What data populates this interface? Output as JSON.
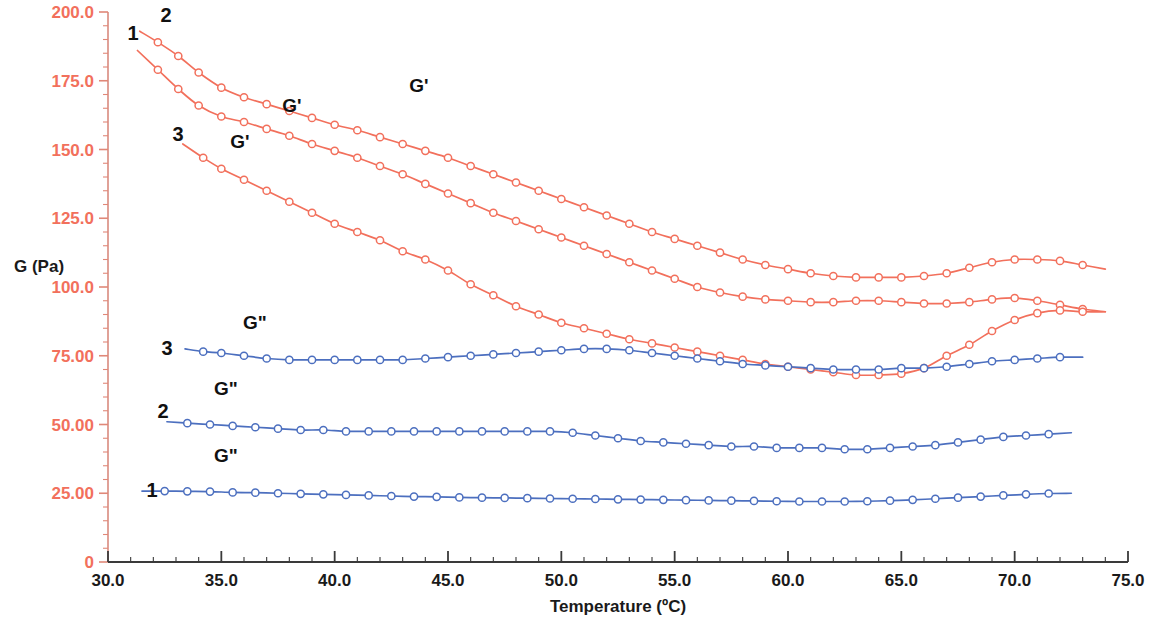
{
  "chart_data": {
    "type": "line",
    "title": "",
    "xlabel": "Temperature (ºC)",
    "ylabel": "G (Pa)",
    "xlim": [
      30.0,
      75.0
    ],
    "ylim": [
      0,
      200
    ],
    "grid": false,
    "legend_position": "inline-annotations",
    "x_ticks": [
      "30.0",
      "35.0",
      "40.0",
      "45.0",
      "50.0",
      "55.0",
      "60.0",
      "65.0",
      "70.0",
      "75.0"
    ],
    "x_tick_values": [
      30.0,
      35.0,
      40.0,
      45.0,
      50.0,
      55.0,
      60.0,
      65.0,
      70.0,
      75.0
    ],
    "y_ticks": [
      "0",
      "25.00",
      "50.00",
      "75.00",
      "100.0",
      "125.0",
      "150.0",
      "175.0",
      "200.0"
    ],
    "y_tick_values": [
      0,
      25,
      50,
      75,
      100,
      125,
      150,
      175,
      200
    ],
    "colors": {
      "storage_modulus": "#f2705c",
      "loss_modulus": "#4c6fbf",
      "axis_y_labels": "#f2705c",
      "axis_x_labels": "#1a1a1a",
      "annotation": "#111111",
      "axis_line": "#555555"
    },
    "series": [
      {
        "name": "G' 2",
        "label": "G'",
        "number": "2",
        "modulus": "storage",
        "color": "#f2705c",
        "x": [
          31.4,
          32.2,
          33.1,
          34.0,
          35.0,
          36.0,
          37.0,
          38.0,
          39.0,
          40.0,
          41.0,
          42.0,
          43.0,
          44.0,
          45.0,
          46.0,
          47.0,
          48.0,
          49.0,
          50.0,
          51.0,
          52.0,
          53.0,
          54.0,
          55.0,
          56.0,
          57.0,
          58.0,
          59.0,
          60.0,
          61.0,
          62.0,
          63.0,
          64.0,
          65.0,
          66.0,
          67.0,
          68.0,
          69.0,
          70.0,
          71.0,
          72.0,
          73.0,
          74.0
        ],
        "y": [
          193.0,
          189.0,
          184.0,
          178.0,
          172.5,
          169.0,
          166.5,
          164.0,
          161.5,
          159.0,
          157.0,
          154.5,
          152.0,
          149.5,
          147.0,
          144.0,
          141.0,
          138.0,
          135.0,
          132.0,
          129.0,
          126.0,
          123.0,
          120.0,
          117.5,
          115.0,
          112.5,
          110.0,
          108.0,
          106.5,
          105.0,
          104.0,
          103.5,
          103.5,
          103.5,
          104.0,
          105.0,
          107.0,
          109.0,
          110.0,
          110.0,
          109.5,
          108.0,
          106.5
        ]
      },
      {
        "name": "G' 1",
        "label": "G'",
        "number": "1",
        "modulus": "storage",
        "color": "#f2705c",
        "x": [
          31.3,
          32.2,
          33.1,
          34.0,
          35.0,
          36.0,
          37.0,
          38.0,
          39.0,
          40.0,
          41.0,
          42.0,
          43.0,
          44.0,
          45.0,
          46.0,
          47.0,
          48.0,
          49.0,
          50.0,
          51.0,
          52.0,
          53.0,
          54.0,
          55.0,
          56.0,
          57.0,
          58.0,
          59.0,
          60.0,
          61.0,
          62.0,
          63.0,
          64.0,
          65.0,
          66.0,
          67.0,
          68.0,
          69.0,
          70.0,
          71.0,
          72.0,
          73.0,
          74.0
        ],
        "y": [
          186.0,
          179.0,
          172.0,
          166.0,
          162.0,
          160.0,
          157.5,
          155.0,
          152.0,
          149.5,
          147.0,
          144.0,
          141.0,
          137.5,
          134.0,
          130.5,
          127.0,
          124.0,
          121.0,
          118.0,
          115.0,
          112.0,
          109.0,
          106.0,
          103.0,
          100.0,
          98.0,
          96.5,
          95.5,
          95.0,
          94.5,
          94.5,
          95.0,
          95.0,
          94.5,
          94.0,
          94.0,
          94.5,
          95.5,
          96.0,
          95.0,
          93.5,
          92.0,
          91.0
        ]
      },
      {
        "name": "G' 3",
        "label": "G'",
        "number": "3",
        "modulus": "storage",
        "color": "#f2705c",
        "x": [
          33.3,
          34.2,
          35.0,
          36.0,
          37.0,
          38.0,
          39.0,
          40.0,
          41.0,
          42.0,
          43.0,
          44.0,
          45.0,
          46.0,
          47.0,
          48.0,
          49.0,
          50.0,
          51.0,
          52.0,
          53.0,
          54.0,
          55.0,
          56.0,
          57.0,
          58.0,
          59.0,
          60.0,
          61.0,
          62.0,
          63.0,
          64.0,
          65.0,
          66.0,
          67.0,
          68.0,
          69.0,
          70.0,
          71.0,
          72.0,
          73.0,
          74.0
        ],
        "y": [
          152.0,
          147.0,
          143.0,
          139.0,
          135.0,
          131.0,
          127.0,
          123.0,
          120.0,
          117.0,
          113.0,
          110.0,
          106.0,
          101.0,
          97.0,
          93.0,
          90.0,
          87.0,
          85.0,
          83.0,
          81.0,
          79.5,
          78.0,
          76.5,
          75.0,
          73.5,
          72.0,
          71.0,
          70.0,
          69.0,
          68.0,
          68.0,
          68.5,
          70.5,
          75.0,
          79.0,
          84.0,
          88.0,
          90.5,
          91.5,
          91.0,
          91.0
        ]
      },
      {
        "name": "G\" 3",
        "label": "G\"",
        "number": "3",
        "modulus": "loss",
        "color": "#4c6fbf",
        "x": [
          33.4,
          34.2,
          35.0,
          36.0,
          37.0,
          38.0,
          39.0,
          40.0,
          41.0,
          42.0,
          43.0,
          44.0,
          45.0,
          46.0,
          47.0,
          48.0,
          49.0,
          50.0,
          51.0,
          52.0,
          53.0,
          54.0,
          55.0,
          56.0,
          57.0,
          58.0,
          59.0,
          60.0,
          61.0,
          62.0,
          63.0,
          64.0,
          65.0,
          66.0,
          67.0,
          68.0,
          69.0,
          70.0,
          71.0,
          72.0,
          73.0
        ],
        "y": [
          77.5,
          76.5,
          76.0,
          75.0,
          74.0,
          73.5,
          73.5,
          73.5,
          73.5,
          73.5,
          73.5,
          74.0,
          74.5,
          75.0,
          75.5,
          76.0,
          76.5,
          77.0,
          77.5,
          77.5,
          77.0,
          76.0,
          75.0,
          74.0,
          73.0,
          72.0,
          71.5,
          71.0,
          70.5,
          70.0,
          70.0,
          70.0,
          70.5,
          70.5,
          71.0,
          72.0,
          73.0,
          73.5,
          74.0,
          74.5,
          74.5
        ]
      },
      {
        "name": "G\" 2",
        "label": "G\"",
        "number": "2",
        "modulus": "loss",
        "color": "#4c6fbf",
        "x": [
          32.6,
          33.5,
          34.5,
          35.5,
          36.5,
          37.5,
          38.5,
          39.5,
          40.5,
          41.5,
          42.5,
          43.5,
          44.5,
          45.5,
          46.5,
          47.5,
          48.5,
          49.5,
          50.5,
          51.5,
          52.5,
          53.5,
          54.5,
          55.5,
          56.5,
          57.5,
          58.5,
          59.5,
          60.5,
          61.5,
          62.5,
          63.5,
          64.5,
          65.5,
          66.5,
          67.5,
          68.5,
          69.5,
          70.5,
          71.5,
          72.5
        ],
        "y": [
          51.0,
          50.5,
          50.0,
          49.5,
          49.0,
          48.5,
          48.0,
          48.0,
          47.5,
          47.5,
          47.5,
          47.5,
          47.5,
          47.5,
          47.5,
          47.5,
          47.5,
          47.5,
          47.0,
          46.0,
          45.0,
          44.0,
          43.5,
          43.0,
          42.5,
          42.0,
          42.0,
          41.5,
          41.5,
          41.5,
          41.0,
          41.0,
          41.5,
          42.0,
          42.5,
          43.5,
          44.5,
          45.5,
          46.0,
          46.5,
          47.0
        ]
      },
      {
        "name": "G\" 1",
        "label": "G\"",
        "number": "1",
        "modulus": "loss",
        "color": "#4c6fbf",
        "x": [
          31.5,
          32.5,
          33.5,
          34.5,
          35.5,
          36.5,
          37.5,
          38.5,
          39.5,
          40.5,
          41.5,
          42.5,
          43.5,
          44.5,
          45.5,
          46.5,
          47.5,
          48.5,
          49.5,
          50.5,
          51.5,
          52.5,
          53.5,
          54.5,
          55.5,
          56.5,
          57.5,
          58.5,
          59.5,
          60.5,
          61.5,
          62.5,
          63.5,
          64.5,
          65.5,
          66.5,
          67.5,
          68.5,
          69.5,
          70.5,
          71.5,
          72.5
        ],
        "y": [
          25.8,
          25.8,
          25.7,
          25.6,
          25.3,
          25.2,
          25.0,
          24.8,
          24.6,
          24.4,
          24.2,
          24.0,
          23.8,
          23.7,
          23.5,
          23.4,
          23.3,
          23.2,
          23.1,
          23.0,
          22.9,
          22.8,
          22.7,
          22.6,
          22.5,
          22.4,
          22.3,
          22.2,
          22.1,
          22.0,
          22.0,
          22.0,
          22.1,
          22.3,
          22.6,
          23.0,
          23.4,
          23.8,
          24.2,
          24.6,
          24.9,
          25.0
        ]
      }
    ],
    "annotations": [
      {
        "text": "1",
        "x_px": 133,
        "y_px": 40,
        "kind": "series-number"
      },
      {
        "text": "2",
        "x_px": 166,
        "y_px": 22,
        "kind": "series-number"
      },
      {
        "text": "3",
        "x_px": 178,
        "y_px": 141,
        "kind": "series-number"
      },
      {
        "text": "G'",
        "x_px": 292,
        "y_px": 112,
        "kind": "series-label"
      },
      {
        "text": "G'",
        "x_px": 419,
        "y_px": 92,
        "kind": "series-label"
      },
      {
        "text": "G'",
        "x_px": 240,
        "y_px": 148,
        "kind": "series-label"
      },
      {
        "text": "3",
        "x_px": 167,
        "y_px": 355,
        "kind": "series-number"
      },
      {
        "text": "2",
        "x_px": 163,
        "y_px": 418,
        "kind": "series-number"
      },
      {
        "text": "1",
        "x_px": 152,
        "y_px": 497,
        "kind": "series-number"
      },
      {
        "text": "G\"",
        "x_px": 255,
        "y_px": 329,
        "kind": "series-label"
      },
      {
        "text": "G\"",
        "x_px": 226,
        "y_px": 395,
        "kind": "series-label"
      },
      {
        "text": "G\"",
        "x_px": 226,
        "y_px": 462,
        "kind": "series-label"
      }
    ]
  }
}
